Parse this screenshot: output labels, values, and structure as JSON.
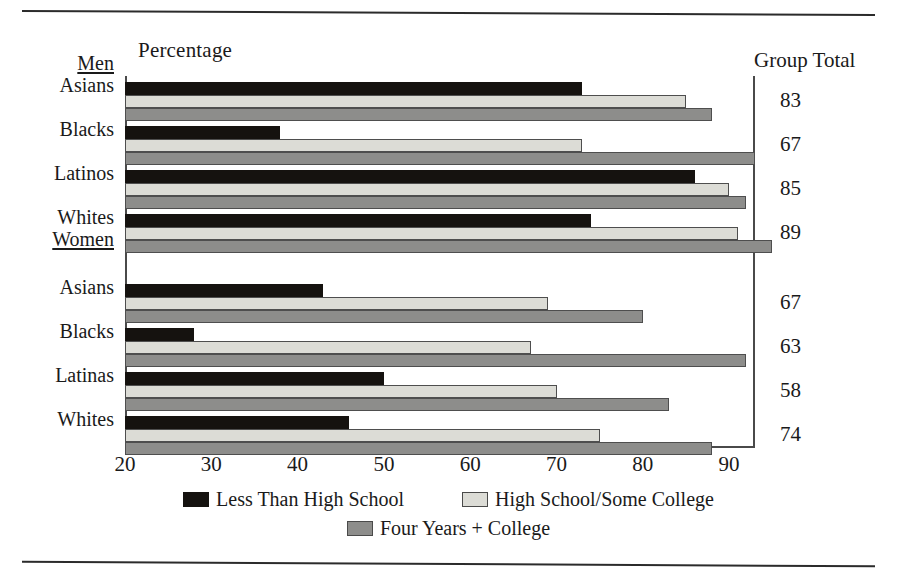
{
  "headers": {
    "axis_caption": "Percentage",
    "group_total": "Group Total"
  },
  "sections": [
    {
      "label": "Men"
    },
    {
      "label": "Women"
    }
  ],
  "row_labels": [
    "Asians",
    "Blacks",
    "Latinos",
    "Whites",
    "Asians",
    "Blacks",
    "Latinas",
    "Whites"
  ],
  "totals": [
    "83",
    "67",
    "85",
    "89",
    "67",
    "63",
    "58",
    "74"
  ],
  "xticks": [
    "20",
    "30",
    "40",
    "50",
    "60",
    "70",
    "80",
    "90"
  ],
  "legend": [
    {
      "name": "Less Than High School",
      "color": "#15120f"
    },
    {
      "name": "High School/Some College",
      "color": "#dcdcd6"
    },
    {
      "name": "Four Years + College",
      "color": "#8d8d8b"
    }
  ],
  "chart_data": {
    "type": "bar",
    "title": "",
    "orientation": "horizontal",
    "xlabel": "Percentage",
    "ylabel": "",
    "xlim": [
      20,
      93
    ],
    "xticks": [
      20,
      30,
      40,
      50,
      60,
      70,
      80,
      90
    ],
    "grid": false,
    "legend_position": "bottom",
    "groups": [
      "Men",
      "Women"
    ],
    "categories": [
      "Men: Asians",
      "Men: Blacks",
      "Men: Latinos",
      "Men: Whites",
      "Women: Asians",
      "Women: Blacks",
      "Women: Latinas",
      "Women: Whites"
    ],
    "series": [
      {
        "name": "Less Than High School",
        "color": "#15120f",
        "values": [
          73,
          38,
          86,
          74,
          43,
          28,
          50,
          46
        ]
      },
      {
        "name": "High School/Some College",
        "color": "#dcdcd6",
        "values": [
          85,
          73,
          90,
          91,
          69,
          67,
          70,
          75
        ]
      },
      {
        "name": "Four Years + College",
        "color": "#8d8d8b",
        "values": [
          88,
          93,
          92,
          95,
          80,
          92,
          83,
          88
        ]
      }
    ],
    "group_total": {
      "label": "Group Total",
      "values": [
        83,
        67,
        85,
        89,
        67,
        63,
        58,
        74
      ]
    }
  }
}
